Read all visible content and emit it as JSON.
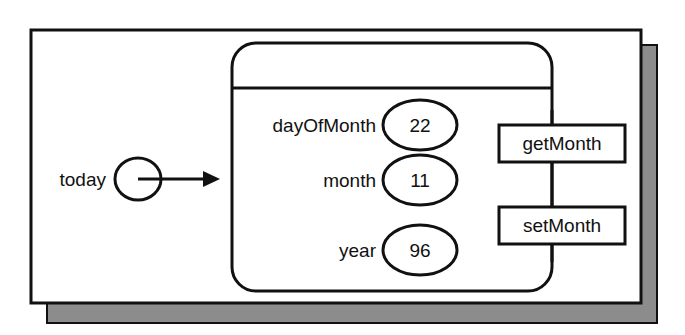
{
  "diagram": {
    "type": "object-instance-diagram",
    "colors": {
      "stroke": "#111111",
      "shadow": "#8c8c8c",
      "background": "#ffffff",
      "text": "#111111"
    },
    "reference": {
      "label": "today",
      "pointer_icon": "reference-circle-icon",
      "arrow_icon": "arrow-right-icon"
    },
    "object_box": {
      "has_title_bar": true,
      "title": "",
      "fields": [
        {
          "name": "dayOfMonth",
          "value": "22"
        },
        {
          "name": "month",
          "value": "11"
        },
        {
          "name": "year",
          "value": "96"
        }
      ]
    },
    "methods": [
      {
        "label": "getMonth"
      },
      {
        "label": "setMonth"
      }
    ],
    "frame": {
      "has_drop_shadow": true
    }
  }
}
